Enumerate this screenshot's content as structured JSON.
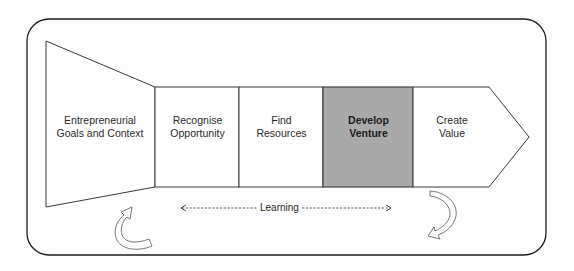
{
  "diagram": {
    "type": "process-flow",
    "stages": [
      {
        "id": "goals",
        "label": "Entrepreneurial\nGoals and Context",
        "highlighted": false,
        "shape": "funnel"
      },
      {
        "id": "recognise",
        "label": "Recognise\nOpportunity",
        "highlighted": false,
        "shape": "box"
      },
      {
        "id": "find",
        "label": "Find\nResources",
        "highlighted": false,
        "shape": "box"
      },
      {
        "id": "develop",
        "label": "Develop\nVenture",
        "highlighted": true,
        "shape": "box"
      },
      {
        "id": "create",
        "label": "Create\nValue",
        "highlighted": false,
        "shape": "chevron"
      }
    ],
    "learning_label": "Learning",
    "learning_arrow": "bidirectional-dashed",
    "feedback_arrows": [
      "curved-arrow-left",
      "curved-arrow-right"
    ],
    "colors": {
      "outline": "#3a3a3a",
      "highlight_fill": "#a9a9a9",
      "box_fill": "#ffffff",
      "background": "#fdfdfd"
    }
  }
}
